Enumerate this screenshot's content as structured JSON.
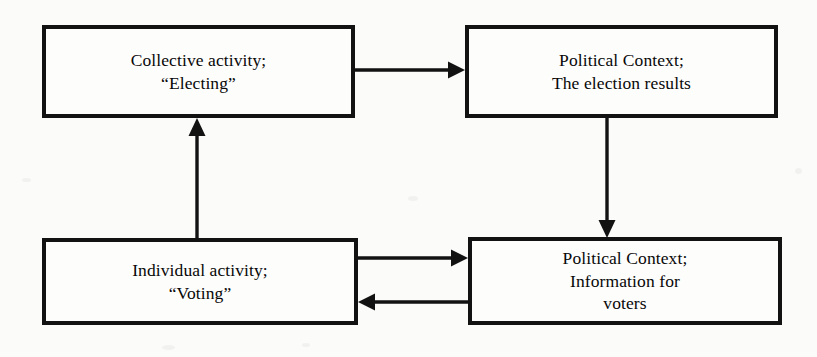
{
  "diagram": {
    "nodes": [
      {
        "id": "collective",
        "label": "Collective activity;\n“Electing”",
        "position": "top-left"
      },
      {
        "id": "results",
        "label": "Political Context;\nThe election results",
        "position": "top-right"
      },
      {
        "id": "individual",
        "label": "Individual activity;\n“Voting”",
        "position": "bottom-left"
      },
      {
        "id": "information",
        "label": "Political Context;\nInformation for\nvoters",
        "position": "bottom-right"
      }
    ],
    "edges": [
      {
        "id": "collective-to-results",
        "from": "collective",
        "to": "results",
        "direction": "right",
        "label": ""
      },
      {
        "id": "results-to-information",
        "from": "results",
        "to": "information",
        "direction": "down",
        "label": ""
      },
      {
        "id": "individual-to-information",
        "from": "individual",
        "to": "information",
        "direction": "right",
        "label": ""
      },
      {
        "id": "information-to-individual",
        "from": "information",
        "to": "individual",
        "direction": "left",
        "label": ""
      },
      {
        "id": "individual-to-collective",
        "from": "individual",
        "to": "collective",
        "direction": "up",
        "label": ""
      }
    ],
    "colors": {
      "border": "#121212",
      "background": "#fbfbfa",
      "text": "#080808",
      "arrow": "#121212"
    }
  }
}
